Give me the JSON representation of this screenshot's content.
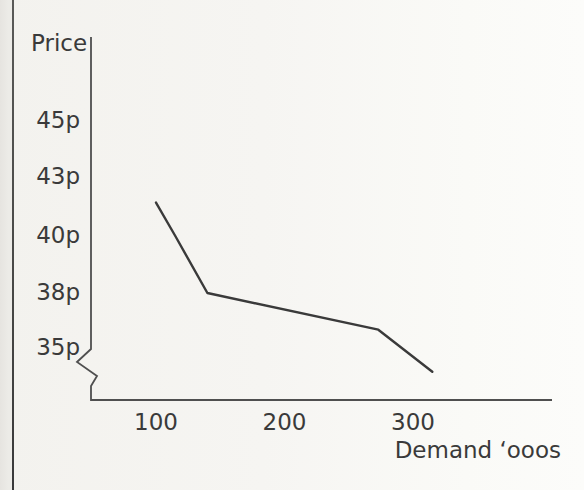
{
  "page": {
    "background": "#f3f2ee",
    "edge_strip_color": "#ecebe7",
    "edge_line_color": "#474745",
    "text_color": "#3a3a3a"
  },
  "chart_data": {
    "type": "line",
    "title": "",
    "ylabel": "Price",
    "xlabel": "Demand ‘ooos",
    "x_axis": {
      "tick_labels": [
        "100",
        "200",
        "300"
      ],
      "tick_values": [
        100,
        200,
        300
      ],
      "range_shown": [
        50,
        410
      ]
    },
    "y_axis": {
      "tick_labels": [
        "45p",
        "43p",
        "40p",
        "38p",
        "35p"
      ],
      "tick_values": [
        45,
        43,
        40,
        38,
        35
      ],
      "unit": "pence",
      "axis_break_below": "35p"
    },
    "series": [
      {
        "name": "demand curve",
        "points": [
          [
            100,
            41.7
          ],
          [
            115,
            40
          ],
          [
            140,
            38
          ],
          [
            273,
            36
          ],
          [
            315,
            33.7
          ]
        ]
      }
    ],
    "grid": false,
    "legend": false,
    "line_color": "#3a3a3a",
    "axis_color": "#4f4f4f"
  }
}
